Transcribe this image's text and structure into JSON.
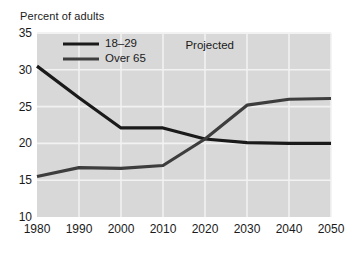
{
  "chart_data": {
    "type": "line",
    "title": "Percent of adults",
    "xlabel": "",
    "ylabel": "Percent of adults",
    "x": [
      1980,
      1990,
      2000,
      2010,
      2020,
      2030,
      2040,
      2050
    ],
    "xticklabels": [
      "1980",
      "1990",
      "2000",
      "2010",
      "2020",
      "2030",
      "2040",
      "2050"
    ],
    "yticklabels": [
      "10",
      "15",
      "20",
      "25",
      "30",
      "35"
    ],
    "yticks": [
      10,
      15,
      20,
      25,
      30,
      35
    ],
    "xlim": [
      1980,
      2050
    ],
    "ylim": [
      10,
      35
    ],
    "grid": true,
    "legend_position": "upper-left-inside",
    "annotations": [
      {
        "text": "Projected",
        "x": 2022,
        "y": 33.2
      }
    ],
    "series": [
      {
        "name": "18–29",
        "color": "#1a1a1a",
        "linewidth": 3.2,
        "values": [
          30.5,
          26.2,
          22.1,
          22.1,
          20.6,
          20.1,
          20.0,
          20.0
        ]
      },
      {
        "name": "Over 65",
        "color": "#3d3d3d",
        "linewidth": 3.2,
        "values": [
          15.5,
          16.7,
          16.6,
          17.0,
          20.6,
          25.2,
          26.0,
          26.1
        ]
      }
    ],
    "plot_background": "#d8d8d8",
    "gridline_color": "#f2f2f2",
    "page_background": "#ffffff"
  },
  "legend": {
    "items": [
      {
        "label": "18–29"
      },
      {
        "label": "Over 65"
      }
    ]
  },
  "annotation": {
    "projected": "Projected"
  }
}
